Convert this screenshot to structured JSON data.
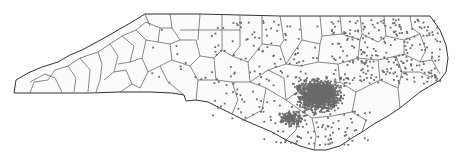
{
  "map": {
    "region": "North Carolina",
    "boundaries": "counties",
    "colors": {
      "background": "#ffffff",
      "land": "#fbfbfb",
      "boundary": "#444444",
      "points": "#6a6a6a"
    },
    "point_layer": {
      "type": "dot-density",
      "densest_area": "east-central (coastal plain)",
      "sparse_area": "western mountains"
    }
  }
}
